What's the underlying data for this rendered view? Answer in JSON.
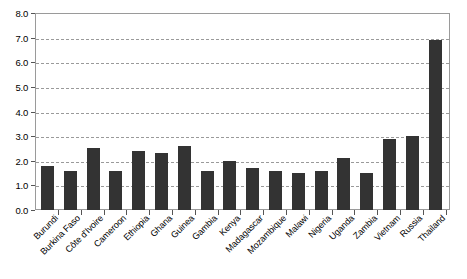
{
  "chart_data": {
    "type": "bar",
    "title": "",
    "xlabel": "",
    "ylabel": "",
    "ylim": [
      0.0,
      8.0
    ],
    "grid": true,
    "legend": "none",
    "bar_color": "#333333",
    "categories": [
      "Burundi",
      "Burkina Faso",
      "Côte d'Ivoire",
      "Cameroon",
      "Ethiopia",
      "Ghana",
      "Guinea",
      "Gambia",
      "Kenya",
      "Madagascar",
      "Mozambique",
      "Malawi",
      "Nigeria",
      "Uganda",
      "Zambia",
      "Vietnam",
      "Russia",
      "Thailand"
    ],
    "values": [
      1.8,
      1.6,
      2.5,
      1.6,
      2.4,
      2.3,
      2.6,
      1.6,
      2.0,
      1.7,
      1.6,
      1.5,
      1.6,
      2.1,
      1.5,
      2.9,
      3.0,
      6.9
    ],
    "ytick_labels": [
      "0.0",
      "1.0",
      "2.0",
      "3.0",
      "4.0",
      "5.0",
      "6.0",
      "7.0",
      "8.0"
    ],
    "ytick_values": [
      0.0,
      1.0,
      2.0,
      3.0,
      4.0,
      5.0,
      6.0,
      7.0,
      8.0
    ]
  }
}
